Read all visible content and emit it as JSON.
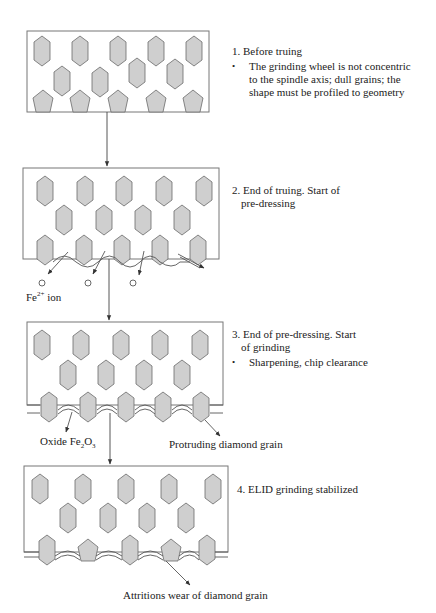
{
  "colors": {
    "grain_fill": "#cfcfcf",
    "grain_stroke": "#6a6a6a",
    "box_stroke": "#777777",
    "line": "#444444"
  },
  "steps": [
    {
      "number": "1.",
      "title": "Before truing",
      "title_cont": "",
      "bullet": "The grinding wheel is not concentric to the spindle axis; dull grains; the shape must be profiled to geometry"
    },
    {
      "number": "2.",
      "title": "End of truing. Start of",
      "title_cont": "pre-dressing",
      "bullet": ""
    },
    {
      "number": "3.",
      "title": "End of pre-dressing. Start",
      "title_cont": "of grinding",
      "bullet": "Sharpening, chip clearance"
    },
    {
      "number": "4.",
      "title": "ELID grinding stabilized",
      "title_cont": "",
      "bullet": ""
    }
  ],
  "annotations": {
    "fe_ion": "Fe",
    "fe_ion_charge": "2+",
    "fe_ion_suffix": " ion",
    "oxide_prefix": "Oxide Fe",
    "oxide_sub1": "2",
    "oxide_mid": "O",
    "oxide_sub2": "3",
    "protruding": "Protruding diamond grain",
    "attrition": "Attritions wear of diamond grain"
  },
  "boxes": [
    {
      "x": 27,
      "y": 31,
      "w": 182,
      "h": 81,
      "hexes": [
        [
          42,
          51
        ],
        [
          80,
          51
        ],
        [
          118,
          51
        ],
        [
          156,
          51
        ],
        [
          194,
          51
        ],
        [
          62,
          81
        ],
        [
          100,
          82
        ],
        [
          137,
          73
        ],
        [
          175,
          74
        ]
      ],
      "pents": [
        [
          43,
          101
        ],
        [
          80,
          101
        ],
        [
          118,
          101
        ],
        [
          156,
          101
        ],
        [
          193,
          101
        ]
      ]
    },
    {
      "x": 23,
      "y": 168,
      "w": 196,
      "h": 91,
      "hexes": [
        [
          45,
          191
        ],
        [
          85,
          191
        ],
        [
          124,
          191
        ],
        [
          164,
          191
        ],
        [
          204,
          191
        ],
        [
          64,
          220
        ],
        [
          104,
          220
        ],
        [
          143,
          220
        ],
        [
          182,
          220
        ],
        [
          45,
          250
        ],
        [
          84,
          250
        ],
        [
          122,
          250
        ],
        [
          160,
          250
        ],
        [
          198,
          250
        ]
      ],
      "pents": []
    },
    {
      "x": 27,
      "y": 322,
      "w": 196,
      "h": 83,
      "hexes": [
        [
          42,
          345
        ],
        [
          81,
          345
        ],
        [
          121,
          345
        ],
        [
          160,
          345
        ],
        [
          200,
          345
        ],
        [
          68,
          375
        ],
        [
          106,
          375
        ],
        [
          144,
          375
        ],
        [
          182,
          375
        ],
        [
          49,
          407
        ],
        [
          88,
          407
        ],
        [
          126,
          407
        ],
        [
          163,
          407
        ],
        [
          201,
          407
        ]
      ],
      "pents": []
    },
    {
      "x": 24,
      "y": 466,
      "w": 204,
      "h": 86,
      "hexes": [
        [
          40,
          489
        ],
        [
          83,
          489
        ],
        [
          126,
          489
        ],
        [
          169,
          489
        ],
        [
          213,
          489
        ],
        [
          68,
          518
        ],
        [
          108,
          518
        ],
        [
          147,
          518
        ],
        [
          186,
          518
        ],
        [
          47,
          550
        ],
        [
          130,
          550
        ],
        [
          207,
          550
        ]
      ],
      "pents": [
        [
          88,
          550
        ],
        [
          171,
          550
        ]
      ]
    }
  ],
  "ions": [
    [
      42,
      283
    ],
    [
      88,
      283
    ],
    [
      133,
      283
    ]
  ]
}
